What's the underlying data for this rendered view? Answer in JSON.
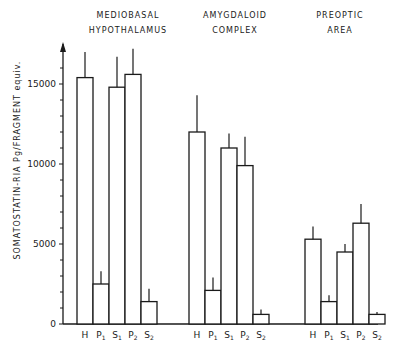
{
  "chart_data": {
    "type": "bar",
    "title": "",
    "ylabel": "SOMATOSTATIN-RIA   Pg/FRAGMENT equiv.",
    "xlabel": "",
    "ylim": [
      0,
      17500
    ],
    "yticks": [
      0,
      5000,
      10000,
      15000
    ],
    "yticks_minor_step": 1000,
    "grid": false,
    "error_bars": true,
    "categories": [
      "H",
      "P1",
      "S1",
      "P2",
      "S2"
    ],
    "groups": [
      {
        "name": "MEDIOBASAL HYPOTHALAMUS",
        "title_lines": [
          "MEDIOBASAL",
          "HYPOTHALAMUS"
        ],
        "values": [
          15400,
          2500,
          14800,
          15600,
          1400
        ],
        "errors": [
          1600,
          800,
          1900,
          1600,
          800
        ]
      },
      {
        "name": "AMYGDALOID COMPLEX",
        "title_lines": [
          "AMYGDALOID",
          "COMPLEX"
        ],
        "values": [
          12000,
          2100,
          11000,
          9900,
          600
        ],
        "errors": [
          2300,
          800,
          900,
          1800,
          300
        ]
      },
      {
        "name": "PREOPTIC AREA",
        "title_lines": [
          "PREOPTIC",
          "AREA"
        ],
        "values": [
          5300,
          1400,
          4500,
          6300,
          600
        ],
        "errors": [
          800,
          400,
          500,
          1200,
          150
        ]
      }
    ],
    "colors": {
      "bar_fill": "#ffffff",
      "stroke": "#1a1a1a"
    }
  },
  "labels": {
    "ylabel": "SOMATOSTATIN-RIA   Pg/FRAGMENT equiv.",
    "tick_0": "0",
    "tick_5000": "5000",
    "tick_10000": "10000",
    "tick_15000": "15000",
    "group1_line1": "MEDIOBASAL",
    "group1_line2": "HYPOTHALAMUS",
    "group2_line1": "AMYGDALOID",
    "group2_line2": "COMPLEX",
    "group3_line1": "PREOPTIC",
    "group3_line2": "AREA"
  }
}
